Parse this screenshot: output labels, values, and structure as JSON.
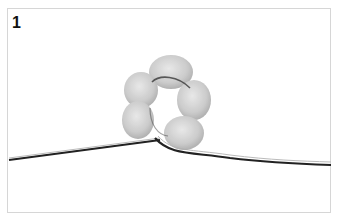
{
  "figure": {
    "step_number": "1",
    "illustration": "beads-on-wire-icon",
    "colors": {
      "frame": "#d6d6d6",
      "bead": "#c8c8c8",
      "wire": "#222222"
    }
  }
}
